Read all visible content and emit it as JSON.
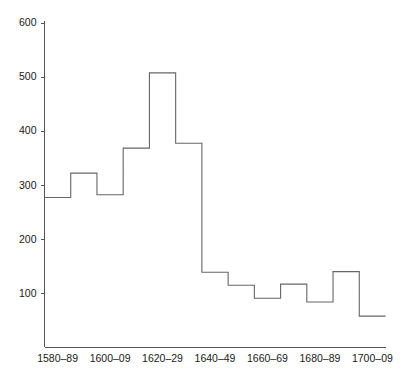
{
  "chart_data": {
    "type": "bar",
    "title": "",
    "subtitle": "",
    "xlabel": "",
    "ylabel": "",
    "categories": [
      "1580-89",
      "1590-99",
      "1600-09",
      "1610-19",
      "1620-29",
      "1630-39",
      "1640-49",
      "1650-59",
      "1660-69",
      "1670-79",
      "1680-89",
      "1690-99",
      "1700-09"
    ],
    "values": [
      277,
      322,
      282,
      368,
      507,
      377,
      139,
      115,
      91,
      117,
      84,
      140,
      58
    ],
    "bin_edges": [
      1580,
      1590,
      1600,
      1610,
      1620,
      1630,
      1640,
      1650,
      1660,
      1670,
      1680,
      1690,
      1700,
      1710
    ],
    "xlim": [
      1580,
      1710
    ],
    "ylim": [
      0,
      600
    ],
    "y_ticks": [
      100,
      200,
      300,
      400,
      500,
      600
    ],
    "y_tick_labels": [
      "100",
      "200",
      "300",
      "400",
      "500",
      "600"
    ],
    "x_ticks": [
      1585,
      1605,
      1625,
      1645,
      1665,
      1685,
      1705
    ],
    "x_tick_labels": [
      "1580–89",
      "1600–09",
      "1620–29",
      "1640–49",
      "1660–69",
      "1680–89",
      "1700–09"
    ],
    "grid": false,
    "legend": null,
    "legend_position": "none",
    "style": {
      "line_color": "#666666",
      "axis_color": "#555555",
      "text_color": "#1a1a1a",
      "background": "#ffffff"
    },
    "annotations": []
  }
}
